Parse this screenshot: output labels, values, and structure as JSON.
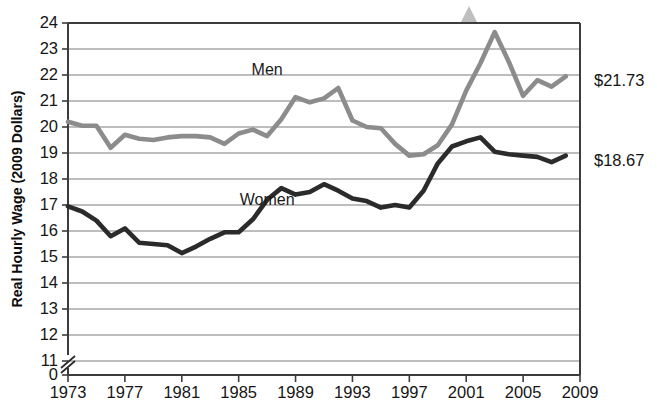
{
  "chart_data": {
    "type": "line",
    "title": "",
    "xlabel": "",
    "ylabel": "Real Hourly Wage (2009 Dollars)",
    "xlim": [
      1973,
      2009
    ],
    "ylim": [
      11,
      24
    ],
    "y_axis_break": true,
    "y_axis_break_note": "axis broken between 0 and 11",
    "grid": "horizontal",
    "legend": "inline-labels",
    "x": [
      1973,
      1974,
      1975,
      1976,
      1977,
      1978,
      1979,
      1980,
      1981,
      1982,
      1983,
      1984,
      1985,
      1986,
      1987,
      1988,
      1989,
      1990,
      1991,
      1992,
      1993,
      1994,
      1995,
      1996,
      1997,
      1998,
      1999,
      2000,
      2001,
      2002,
      2003,
      2004,
      2005,
      2006,
      2007,
      2008
    ],
    "ytick_labels": [
      "24",
      "23",
      "22",
      "21",
      "20",
      "19",
      "18",
      "17",
      "16",
      "15",
      "14",
      "13",
      "12",
      "11",
      "0"
    ],
    "ytick_values": [
      24,
      23,
      22,
      21,
      20,
      19,
      18,
      17,
      16,
      15,
      14,
      13,
      12,
      11,
      0
    ],
    "xtick_labels": [
      "1973",
      "1977",
      "1981",
      "1985",
      "1989",
      "1993",
      "1997",
      "2001",
      "2005",
      "2009"
    ],
    "xtick_values": [
      1973,
      1977,
      1981,
      1985,
      1989,
      1993,
      1997,
      2001,
      2005,
      2009
    ],
    "series": [
      {
        "name": "Men",
        "color": "#8c8c8c",
        "label_text": "Men",
        "label_x": 1987,
        "label_y": 22.0,
        "end_label": "$21.73",
        "end_value": 21.73,
        "values": [
          20.2,
          20.05,
          20.05,
          19.2,
          19.7,
          19.55,
          19.5,
          19.6,
          19.65,
          19.65,
          19.6,
          19.35,
          19.75,
          19.9,
          19.65,
          20.3,
          21.15,
          20.95,
          21.1,
          21.5,
          20.25,
          20.0,
          19.95,
          19.35,
          18.9,
          18.95,
          19.3,
          20.1,
          21.4,
          22.45,
          23.65,
          22.5,
          21.2,
          21.8,
          21.55,
          21.95
        ]
      },
      {
        "name": "Women",
        "color": "#2b2b2b",
        "label_text": "Women",
        "label_x": 1987,
        "label_y": 17.0,
        "end_label": "$18.67",
        "end_value": 18.67,
        "values": [
          16.95,
          16.75,
          16.4,
          15.8,
          16.1,
          15.55,
          15.5,
          15.45,
          15.15,
          15.4,
          15.7,
          15.95,
          15.95,
          16.45,
          17.2,
          17.65,
          17.4,
          17.5,
          17.8,
          17.55,
          17.25,
          17.15,
          16.9,
          17.0,
          16.9,
          17.55,
          18.6,
          19.25,
          19.45,
          19.6,
          19.05,
          18.95,
          18.9,
          18.85,
          18.65,
          18.9
        ]
      }
    ]
  },
  "axes": {
    "y_title": "Real Hourly Wage (2009 Dollars)"
  }
}
